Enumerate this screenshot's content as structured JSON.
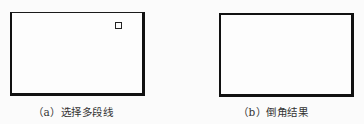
{
  "figures": [
    {
      "id": "a",
      "caption": "（a）选择多段线",
      "shape": "rectangle-polyline",
      "selected": true,
      "grip_marker": "square-grip"
    },
    {
      "id": "b",
      "caption": "（b）倒角结果",
      "shape": "rectangle-polyline",
      "selected": false
    }
  ]
}
